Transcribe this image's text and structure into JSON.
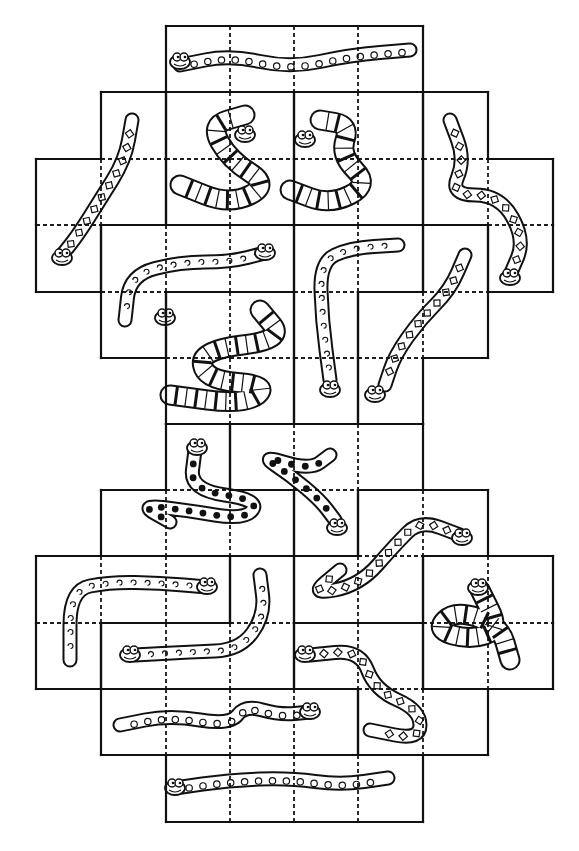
{
  "puzzle": {
    "title": "Snake tile puzzle",
    "grid": {
      "cols": [
        36,
        101,
        166,
        230,
        294,
        358,
        423,
        488,
        553
      ],
      "rows": [
        26,
        92,
        159,
        225,
        292,
        358,
        424,
        490,
        556,
        623,
        689,
        755,
        822
      ]
    },
    "colors": {
      "line": "#111111",
      "background": "#ffffff"
    },
    "pieces": [
      {
        "id": "p1",
        "shape": "I",
        "cells": [
          [
            2,
            0
          ],
          [
            3,
            0
          ],
          [
            4,
            0
          ],
          [
            5,
            0
          ]
        ],
        "pattern": "spots",
        "snake": [
          [
            180,
            65
          ],
          [
            230,
            55
          ],
          [
            290,
            68
          ],
          [
            350,
            55
          ],
          [
            410,
            50
          ]
        ],
        "head": [
          180,
          62
        ]
      },
      {
        "id": "p2",
        "shape": "S",
        "cells": [
          [
            1,
            1
          ],
          [
            1,
            2
          ],
          [
            0,
            2
          ],
          [
            0,
            3
          ]
        ],
        "pattern": "diamonds",
        "snake": [
          [
            132,
            120
          ],
          [
            125,
            160
          ],
          [
            100,
            200
          ],
          [
            78,
            235
          ],
          [
            62,
            255
          ]
        ],
        "head": [
          62,
          258
        ]
      },
      {
        "id": "p3",
        "shape": "O",
        "cells": [
          [
            2,
            1
          ],
          [
            3,
            1
          ],
          [
            2,
            2
          ],
          [
            3,
            2
          ]
        ],
        "pattern": "bands",
        "snake": [
          [
            180,
            185
          ],
          [
            230,
            205
          ],
          [
            270,
            185
          ],
          [
            230,
            160
          ],
          [
            210,
            125
          ],
          [
            245,
            115
          ]
        ],
        "head": [
          245,
          135
        ]
      },
      {
        "id": "p4",
        "shape": "O",
        "cells": [
          [
            4,
            1
          ],
          [
            5,
            1
          ],
          [
            4,
            2
          ],
          [
            5,
            2
          ]
        ],
        "pattern": "bands",
        "snake": [
          [
            290,
            190
          ],
          [
            330,
            205
          ],
          [
            370,
            185
          ],
          [
            340,
            155
          ],
          [
            350,
            125
          ],
          [
            320,
            120
          ]
        ],
        "head": [
          305,
          140
        ]
      },
      {
        "id": "p5",
        "shape": "S",
        "cells": [
          [
            6,
            1
          ],
          [
            6,
            2
          ],
          [
            7,
            2
          ],
          [
            7,
            3
          ]
        ],
        "pattern": "diamonds",
        "snake": [
          [
            450,
            120
          ],
          [
            465,
            160
          ],
          [
            450,
            195
          ],
          [
            500,
            195
          ],
          [
            525,
            240
          ],
          [
            510,
            275
          ]
        ],
        "head": [
          510,
          278
        ]
      },
      {
        "id": "p6",
        "shape": "L",
        "cells": [
          [
            1,
            3
          ],
          [
            2,
            3
          ],
          [
            3,
            3
          ],
          [
            1,
            4
          ]
        ],
        "pattern": "swirls",
        "snake": [
          [
            125,
            320
          ],
          [
            130,
            275
          ],
          [
            180,
            262
          ],
          [
            230,
            262
          ],
          [
            265,
            253
          ]
        ],
        "head": [
          265,
          253
        ]
      },
      {
        "id": "p7",
        "shape": "O",
        "cells": [
          [
            2,
            4
          ],
          [
            3,
            4
          ],
          [
            2,
            5
          ],
          [
            3,
            5
          ]
        ],
        "pattern": "bands",
        "snake": [
          [
            260,
            310
          ],
          [
            285,
            340
          ],
          [
            200,
            350
          ],
          [
            205,
            380
          ],
          [
            270,
            385
          ],
          [
            245,
            405
          ],
          [
            170,
            395
          ]
        ],
        "head": [
          165,
          318
        ]
      },
      {
        "id": "p8",
        "shape": "L",
        "cells": [
          [
            4,
            3
          ],
          [
            5,
            3
          ],
          [
            4,
            4
          ],
          [
            4,
            5
          ]
        ],
        "pattern": "swirls",
        "snake": [
          [
            398,
            245
          ],
          [
            350,
            248
          ],
          [
            320,
            262
          ],
          [
            322,
            320
          ],
          [
            330,
            380
          ]
        ],
        "head": [
          330,
          390
        ]
      },
      {
        "id": "p9",
        "shape": "S",
        "cells": [
          [
            6,
            3
          ],
          [
            6,
            4
          ],
          [
            5,
            4
          ],
          [
            5,
            5
          ]
        ],
        "pattern": "diamonds",
        "snake": [
          [
            465,
            255
          ],
          [
            450,
            290
          ],
          [
            420,
            320
          ],
          [
            395,
            355
          ],
          [
            385,
            385
          ]
        ],
        "head": [
          375,
          395
        ]
      },
      {
        "id": "p10",
        "shape": "T",
        "cells": [
          [
            2,
            6
          ],
          [
            1,
            7
          ],
          [
            2,
            7
          ],
          [
            3,
            7
          ]
        ],
        "pattern": "dots",
        "snake": [
          [
            195,
            450
          ],
          [
            190,
            490
          ],
          [
            260,
            500
          ],
          [
            245,
            520
          ],
          [
            185,
            510
          ],
          [
            140,
            505
          ],
          [
            170,
            522
          ]
        ],
        "head": [
          197,
          448
        ]
      },
      {
        "id": "p11",
        "shape": "T",
        "cells": [
          [
            3,
            6
          ],
          [
            4,
            6
          ],
          [
            5,
            6
          ],
          [
            4,
            7
          ]
        ],
        "pattern": "dots",
        "snake": [
          [
            330,
            455
          ],
          [
            310,
            470
          ],
          [
            260,
            455
          ],
          [
            290,
            475
          ],
          [
            320,
            500
          ],
          [
            335,
            520
          ]
        ],
        "head": [
          337,
          528
        ]
      },
      {
        "id": "p12",
        "shape": "S",
        "cells": [
          [
            5,
            7
          ],
          [
            6,
            7
          ],
          [
            4,
            8
          ],
          [
            5,
            8
          ]
        ],
        "pattern": "diamonds",
        "snake": [
          [
            460,
            535
          ],
          [
            420,
            520
          ],
          [
            395,
            545
          ],
          [
            360,
            585
          ],
          [
            310,
            595
          ],
          [
            340,
            570
          ]
        ],
        "head": [
          462,
          538
        ]
      },
      {
        "id": "p13",
        "shape": "O",
        "cells": [
          [
            6,
            8
          ],
          [
            7,
            8
          ],
          [
            6,
            9
          ],
          [
            7,
            9
          ]
        ],
        "pattern": "bands",
        "snake": [
          [
            480,
            590
          ],
          [
            500,
            630
          ],
          [
            470,
            640
          ],
          [
            435,
            630
          ],
          [
            455,
            610
          ],
          [
            500,
            625
          ],
          [
            510,
            660
          ]
        ],
        "head": [
          478,
          588
        ]
      },
      {
        "id": "p14",
        "shape": "L",
        "cells": [
          [
            0,
            8
          ],
          [
            1,
            8
          ],
          [
            2,
            8
          ],
          [
            0,
            9
          ]
        ],
        "pattern": "swirls",
        "snake": [
          [
            70,
            660
          ],
          [
            70,
            590
          ],
          [
            110,
            582
          ],
          [
            160,
            583
          ],
          [
            207,
            587
          ]
        ],
        "head": [
          207,
          587
        ]
      },
      {
        "id": "p15",
        "shape": "J",
        "cells": [
          [
            3,
            8
          ],
          [
            3,
            9
          ],
          [
            2,
            9
          ],
          [
            1,
            9
          ]
        ],
        "pattern": "swirls",
        "snake": [
          [
            260,
            575
          ],
          [
            265,
            615
          ],
          [
            240,
            650
          ],
          [
            190,
            652
          ],
          [
            135,
            655
          ]
        ],
        "head": [
          130,
          655
        ]
      },
      {
        "id": "p16",
        "shape": "Z",
        "cells": [
          [
            4,
            9
          ],
          [
            5,
            9
          ],
          [
            5,
            10
          ],
          [
            6,
            10
          ]
        ],
        "pattern": "diamonds",
        "snake": [
          [
            310,
            655
          ],
          [
            360,
            650
          ],
          [
            375,
            690
          ],
          [
            420,
            710
          ],
          [
            420,
            740
          ],
          [
            370,
            730
          ]
        ],
        "head": [
          305,
          655
        ]
      },
      {
        "id": "p17",
        "shape": "I",
        "cells": [
          [
            1,
            10
          ],
          [
            2,
            10
          ],
          [
            3,
            10
          ],
          [
            4,
            10
          ]
        ],
        "pattern": "spots",
        "snake": [
          [
            120,
            725
          ],
          [
            170,
            715
          ],
          [
            230,
            725
          ],
          [
            245,
            705
          ],
          [
            280,
            715
          ],
          [
            310,
            712
          ]
        ],
        "head": [
          310,
          712
        ]
      },
      {
        "id": "p18",
        "shape": "I",
        "cells": [
          [
            2,
            11
          ],
          [
            3,
            11
          ],
          [
            4,
            11
          ],
          [
            5,
            11
          ]
        ],
        "pattern": "spots",
        "snake": [
          [
            175,
            788
          ],
          [
            230,
            780
          ],
          [
            290,
            778
          ],
          [
            340,
            785
          ],
          [
            388,
            778
          ]
        ],
        "head": [
          175,
          788
        ]
      }
    ]
  }
}
